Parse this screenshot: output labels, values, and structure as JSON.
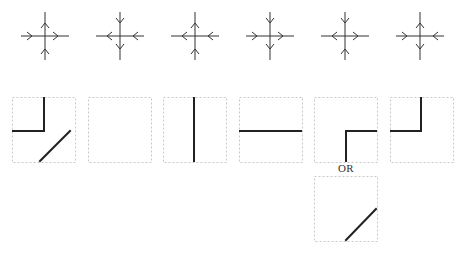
{
  "colors": {
    "arrow": "#333333",
    "line": "#222222",
    "box_border": "#c8c8c8",
    "background": "#ffffff"
  },
  "crosses": [
    {
      "id": 1,
      "cx": 45,
      "cy": 36,
      "top": "out",
      "right": "out",
      "bottom": "in",
      "left": "in"
    },
    {
      "id": 2,
      "cx": 120,
      "cy": 36,
      "top": "in",
      "right": "in",
      "bottom": "out",
      "left": "out"
    },
    {
      "id": 3,
      "cx": 195,
      "cy": 36,
      "top": "out",
      "right": "in",
      "bottom": "in",
      "left": "out"
    },
    {
      "id": 4,
      "cx": 270,
      "cy": 36,
      "top": "in",
      "right": "out",
      "bottom": "out",
      "left": "in"
    },
    {
      "id": 5,
      "cx": 345,
      "cy": 36,
      "top": "in",
      "right": "out",
      "bottom": "in",
      "left": "out"
    },
    {
      "id": 6,
      "cx": 420,
      "cy": 36,
      "top": "out",
      "right": "in",
      "bottom": "out",
      "left": "in"
    }
  ],
  "tiles": [
    {
      "id": 1,
      "x": 12,
      "y": 97,
      "segments": [
        [
          32,
          1,
          32,
          34
        ],
        [
          1,
          34,
          32,
          34
        ],
        [
          28,
          64,
          58,
          34
        ]
      ]
    },
    {
      "id": 2,
      "x": 88,
      "y": 97,
      "segments": []
    },
    {
      "id": 3,
      "x": 163,
      "y": 97,
      "segments": [
        [
          31,
          1,
          31,
          64
        ]
      ]
    },
    {
      "id": 4,
      "x": 239,
      "y": 97,
      "segments": [
        [
          1,
          34,
          62,
          34
        ]
      ]
    },
    {
      "id": 5,
      "x": 314,
      "y": 97,
      "segments": [
        [
          62,
          34,
          32,
          34
        ],
        [
          32,
          34,
          32,
          64
        ]
      ]
    },
    {
      "id": 6,
      "x": 390,
      "y": 97,
      "segments": [
        [
          1,
          34,
          31,
          34
        ],
        [
          31,
          34,
          31,
          1
        ]
      ]
    },
    {
      "id": 7,
      "x": 314,
      "y": 176,
      "segments": [
        [
          32,
          64,
          62,
          33
        ]
      ]
    }
  ],
  "tile_size": {
    "w": 63,
    "h": 65
  },
  "labels": {
    "or": {
      "text": "OR",
      "x": 346,
      "y": 162
    }
  }
}
